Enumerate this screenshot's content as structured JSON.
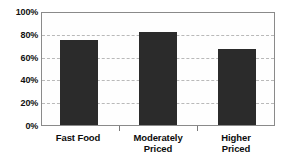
{
  "chart_data": {
    "type": "bar",
    "title": "",
    "subtitle": "",
    "xlabel": "",
    "ylabel": "",
    "categories": [
      "Fast Food",
      "Moderately Priced",
      "Higher Priced"
    ],
    "category_lines": [
      [
        "Fast Food"
      ],
      [
        "Moderately",
        "Priced"
      ],
      [
        "Higher",
        "Priced"
      ]
    ],
    "values": [
      76,
      83,
      68
    ],
    "ylim": [
      0,
      100
    ],
    "yticks": [
      0,
      20,
      40,
      60,
      80,
      100
    ],
    "ytick_labels": [
      "0%",
      "20%",
      "40%",
      "60%",
      "80%",
      "100%"
    ],
    "grid": true,
    "grid_axis": "y",
    "grid_style": "dashed",
    "legend": false,
    "legend_position": "none",
    "value_format": "percent",
    "series": [
      {
        "name": "Percent",
        "values": [
          76,
          83,
          68
        ]
      }
    ],
    "colors": {
      "bar": "#2b2b2b",
      "grid": "#b9b9b9",
      "frame": "#8a8a8a",
      "text": "#0d0d0d",
      "background": "#ffffff",
      "plot_background": "#fefefe"
    }
  }
}
